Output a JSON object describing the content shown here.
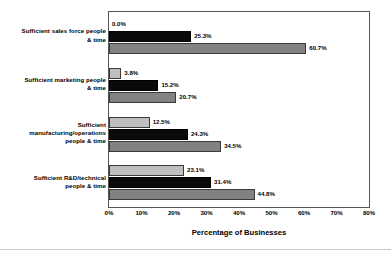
{
  "chart_data": {
    "type": "bar",
    "orientation": "horizontal",
    "title": "",
    "xlabel": "Percentage of Businesses",
    "ylabel": "",
    "xlim": [
      0,
      80
    ],
    "xticks": [
      "0%",
      "10%",
      "20%",
      "30%",
      "40%",
      "50%",
      "60%",
      "70%",
      "80%"
    ],
    "xtick_values": [
      0,
      10,
      20,
      30,
      40,
      50,
      60,
      70,
      80
    ],
    "grid": false,
    "legend_position": "bottom-right",
    "categories": [
      "Sufficient sales force people & time",
      "Sufficient marketing people & time",
      "Sufficient manufacturing/operations people & time",
      "Sufficient R&D/technical people & time"
    ],
    "category_lines": [
      [
        "Sufficient sales force people",
        "& time"
      ],
      [
        "Sufficient marketing people",
        "& time"
      ],
      [
        "Sufficient",
        "manufacturing/operations",
        "people & time"
      ],
      [
        "Sufficient R&D/technical",
        "people & time"
      ]
    ],
    "series": [
      {
        "name": "Worst Performers",
        "color": "#bfbfbf",
        "values": [
          0.0,
          3.8,
          12.5,
          23.1
        ],
        "labels": [
          "0.0%",
          "3.8%",
          "12.5%",
          "23.1%"
        ]
      },
      {
        "name": "Average Business",
        "color": "#0a0a0a",
        "values": [
          25.3,
          15.2,
          24.3,
          31.4
        ],
        "labels": [
          "25.3%",
          "15.2%",
          "24.3%",
          "31.4%"
        ]
      },
      {
        "name": "Best Performers",
        "color": "#828282",
        "values": [
          60.7,
          20.7,
          34.5,
          44.8
        ],
        "labels": [
          "60.7%",
          "20.7%",
          "34.5%",
          "44.8%"
        ]
      }
    ]
  },
  "legend": {
    "items": [
      {
        "label": "Worst Performers",
        "key": "worst"
      },
      {
        "label": "Average Business",
        "key": "avg"
      },
      {
        "label": "Best Performers",
        "key": "best"
      }
    ]
  },
  "axis": {
    "x_title": "Percentage of Businesses"
  }
}
